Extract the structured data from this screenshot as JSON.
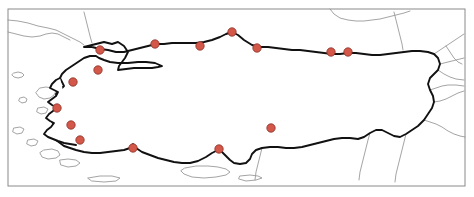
{
  "figure": {
    "width": 474,
    "height": 197,
    "background_color": "#ffffff"
  },
  "frame": {
    "x": 8,
    "y": 9,
    "width": 457,
    "height": 177,
    "stroke_color": "#8a8a8a",
    "stroke_width": 1
  },
  "styles": {
    "country_outline_color": "#111111",
    "country_outline_width": 1.9,
    "country_fill": "#ffffff",
    "neighbor_border_color": "#9a9a9a",
    "neighbor_border_width": 0.9,
    "dot_fill": "#d4584a",
    "dot_stroke": "#8c2f24",
    "dot_radius": 4.2
  },
  "markers": {
    "count": 15,
    "shape": "circle",
    "points": [
      {
        "id": "marker-01",
        "x": 100,
        "y": 50,
        "region": "marmara-north"
      },
      {
        "id": "marker-02",
        "x": 98,
        "y": 70,
        "region": "marmara-south"
      },
      {
        "id": "marker-03",
        "x": 73,
        "y": 82,
        "region": "aegean-north"
      },
      {
        "id": "marker-04",
        "x": 155,
        "y": 44,
        "region": "black-sea-west"
      },
      {
        "id": "marker-05",
        "x": 200,
        "y": 46,
        "region": "central-north"
      },
      {
        "id": "marker-06",
        "x": 232,
        "y": 32,
        "region": "black-sea-central"
      },
      {
        "id": "marker-07",
        "x": 257,
        "y": 48,
        "region": "black-sea-east-central"
      },
      {
        "id": "marker-08",
        "x": 331,
        "y": 52,
        "region": "black-sea-east"
      },
      {
        "id": "marker-09",
        "x": 348,
        "y": 52,
        "region": "black-sea-far-east"
      },
      {
        "id": "marker-10",
        "x": 57,
        "y": 108,
        "region": "aegean-central"
      },
      {
        "id": "marker-11",
        "x": 71,
        "y": 125,
        "region": "aegean-inland"
      },
      {
        "id": "marker-12",
        "x": 80,
        "y": 140,
        "region": "aegean-south"
      },
      {
        "id": "marker-13",
        "x": 133,
        "y": 148,
        "region": "mediterranean-west"
      },
      {
        "id": "marker-14",
        "x": 219,
        "y": 149,
        "region": "mediterranean-central"
      },
      {
        "id": "marker-15",
        "x": 271,
        "y": 128,
        "region": "south-east-inland"
      }
    ]
  },
  "geometry": {
    "country_outline_path": "M 84 47 L 96 44 L 104 42 L 112 44 L 118 42 L 124 46 L 128 52 L 125 58 L 122 62 L 119 66 L 118 70 L 126 69 L 134 68 L 144 68 L 152 68 L 158 67 L 162 66 L 155 63 L 146 62 L 138 62 L 128 63 L 118 63 L 110 62 L 104 60 L 99 58 L 96 56 L 90 56 L 84 58 L 78 62 L 72 66 L 66 70 L 62 74 L 60 78 L 62 82 L 64 86 L 60 90 L 56 94 L 58 98 L 62 100 L 58 104 L 54 108 L 57 112 L 60 114 L 56 118 L 52 122 L 55 126 L 58 128 L 54 132 L 52 136 L 56 140 L 60 143 L 64 146 L 70 148 L 76 150 L 84 152 L 92 153 L 100 153 L 108 152 L 116 151 L 124 150 L 130 148 L 133 144 L 136 148 L 142 152 L 150 155 L 158 158 L 166 160 L 174 162 L 182 163 L 190 163 L 198 161 L 206 157 L 212 153 L 218 150 L 222 152 L 226 156 L 230 160 L 234 163 L 240 164 L 246 163 L 250 159 L 252 154 L 256 150 L 262 148 L 270 147 L 278 147 L 286 148 L 294 148 L 302 147 L 310 145 L 318 143 L 326 141 L 334 139 L 342 138 L 350 138 L 358 139 L 364 137 L 370 133 L 376 130 L 382 130 L 388 133 L 394 136 L 400 137 L 406 134 L 412 130 L 418 126 L 424 120 L 428 114 L 432 108 L 434 102 L 433 96 L 430 90 L 428 84 L 430 78 L 434 74 L 438 70 L 440 64 L 438 58 L 434 54 L 428 52 L 420 51 L 412 51 L 404 52 L 396 53 L 388 54 L 380 55 L 372 55 L 364 54 L 356 53 L 348 53 L 340 54 L 332 54 L 324 53 L 316 52 L 308 51 L 300 50 L 292 50 L 284 49 L 276 48 L 268 47 L 260 47 L 252 45 L 244 40 L 238 35 L 232 32 L 226 34 L 220 37 L 212 40 L 204 42 L 196 43 L 188 43 L 180 43 L 172 43 L 164 44 L 156 44 L 148 46 L 140 48 L 132 50 L 124 52 L 116 52 L 108 50 L 100 49 L 92 47 Z",
    "aegean_coast_path": "M 60 78 L 56 80 L 52 84 L 50 88 L 54 90 L 58 92 L 56 96 L 52 99 L 48 102 L 52 105 L 56 107 L 53 111 L 49 114 L 46 118 L 50 121 L 54 123 L 51 127 L 47 130 L 44 134 L 48 137 L 53 139 L 58 141 L 64 143 L 70 144 L 76 145",
    "neighbor_borders": [
      "M 8 20 L 18 21 L 28 23 L 38 26 L 48 28 L 56 30 L 62 33 L 68 36 L 74 39 L 80 42 L 84 45",
      "M 84 12 L 86 20 L 88 28 L 90 36 L 92 43",
      "M 8 32 L 16 34 L 24 36 L 32 37 L 40 36 L 46 34 L 52 33 L 58 34 L 64 37 L 70 40",
      "M 434 54 L 440 50 L 446 46 L 452 42 L 458 38 L 464 34",
      "M 440 64 L 448 62 L 456 60 L 464 58",
      "M 438 70 L 444 74 L 450 77 L 456 79 L 464 80",
      "M 434 102 L 440 101 L 446 99 L 452 96 L 458 93 L 464 91",
      "M 424 120 L 430 122 L 436 124 L 442 127 L 448 131 L 454 134 L 460 136 L 465 137",
      "M 406 134 L 404 142 L 402 150 L 400 158 L 398 166 L 396 174 L 395 182",
      "M 370 133 L 368 140 L 366 148 L 364 156 L 362 164 L 360 172 L 359 180",
      "M 262 148 L 260 156 L 258 164 L 256 172 L 255 180",
      "M 394 12 L 396 20 L 398 28 L 400 36 L 402 44 L 403 50",
      "M 330 9 L 334 14 L 340 18 L 348 20 L 356 21 L 364 21 L 372 20 L 380 19 L 388 17 L 396 15 L 404 13 L 410 11",
      "M 430 90 L 436 88 L 442 86 L 448 85 L 456 85 L 464 86",
      "M 446 46 L 450 52 L 454 58 L 458 62 L 462 64"
    ],
    "islands": [
      "M 14 73 L 18 72 L 22 73 L 24 75 L 22 77 L 18 78 L 14 77 L 12 75 Z",
      "M 40 88 L 46 87 L 52 88 L 56 91 L 54 95 L 50 98 L 44 99 L 39 97 L 36 93 Z",
      "M 20 98 L 24 97 L 27 99 L 26 102 L 22 103 L 19 101 Z",
      "M 38 108 L 44 107 L 48 109 L 46 113 L 41 114 L 37 112 Z",
      "M 14 128 L 20 127 L 24 129 L 22 133 L 17 134 L 13 132 Z",
      "M 28 140 L 34 139 L 38 141 L 36 145 L 31 146 L 27 144 Z",
      "M 44 150 L 52 149 L 58 151 L 60 155 L 56 158 L 48 159 L 42 157 L 40 153 Z",
      "M 60 160 L 68 159 L 76 160 L 80 163 L 76 166 L 68 167 L 61 165 Z",
      "M 185 168 L 196 166 L 208 166 L 218 167 L 226 169 L 230 172 L 226 175 L 216 177 L 204 178 L 192 177 L 184 174 L 181 171 Z",
      "M 88 178 L 100 176 L 112 176 L 120 178 L 116 181 L 104 182 L 92 181 Z",
      "M 240 176 L 250 175 L 258 176 L 262 178 L 256 180 L 246 181 L 239 179 Z",
      "M 128 60 L 140 59 L 152 59 L 160 60 L 158 63 L 146 64 L 134 64 L 127 62 Z"
    ]
  }
}
